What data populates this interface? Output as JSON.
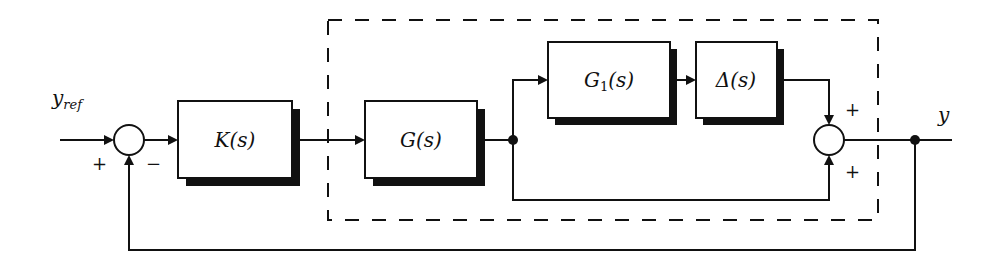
{
  "diagram": {
    "type": "block-diagram",
    "signals": {
      "input": "y",
      "input_subscript": "ref",
      "output": "y"
    },
    "blocks": [
      {
        "id": "controller",
        "label": "K(s)"
      },
      {
        "id": "plant",
        "label": "G(s)"
      },
      {
        "id": "weight",
        "label_main": "G",
        "label_sub": "1",
        "label_tail": "(s)"
      },
      {
        "id": "uncertainty",
        "label": "Δ(s)"
      }
    ],
    "summing_junctions": [
      {
        "id": "sum1",
        "signs": {
          "left": "+",
          "bottom": "−"
        }
      },
      {
        "id": "sum2",
        "signs": {
          "top": "+",
          "bottom": "+"
        }
      }
    ],
    "groups": [
      {
        "id": "uncertain-plant",
        "style": "dashed",
        "contains": [
          "plant",
          "weight",
          "uncertainty",
          "sum2"
        ]
      }
    ],
    "connections": [
      {
        "from": "y_ref",
        "to": "sum1"
      },
      {
        "from": "sum1",
        "to": "controller"
      },
      {
        "from": "controller",
        "to": "plant"
      },
      {
        "from": "plant",
        "to": "weight"
      },
      {
        "from": "weight",
        "to": "uncertainty"
      },
      {
        "from": "uncertainty",
        "to": "sum2"
      },
      {
        "from": "plant",
        "to": "sum2"
      },
      {
        "from": "sum2",
        "to": "y"
      },
      {
        "from": "y",
        "to": "sum1",
        "type": "feedback"
      }
    ]
  }
}
